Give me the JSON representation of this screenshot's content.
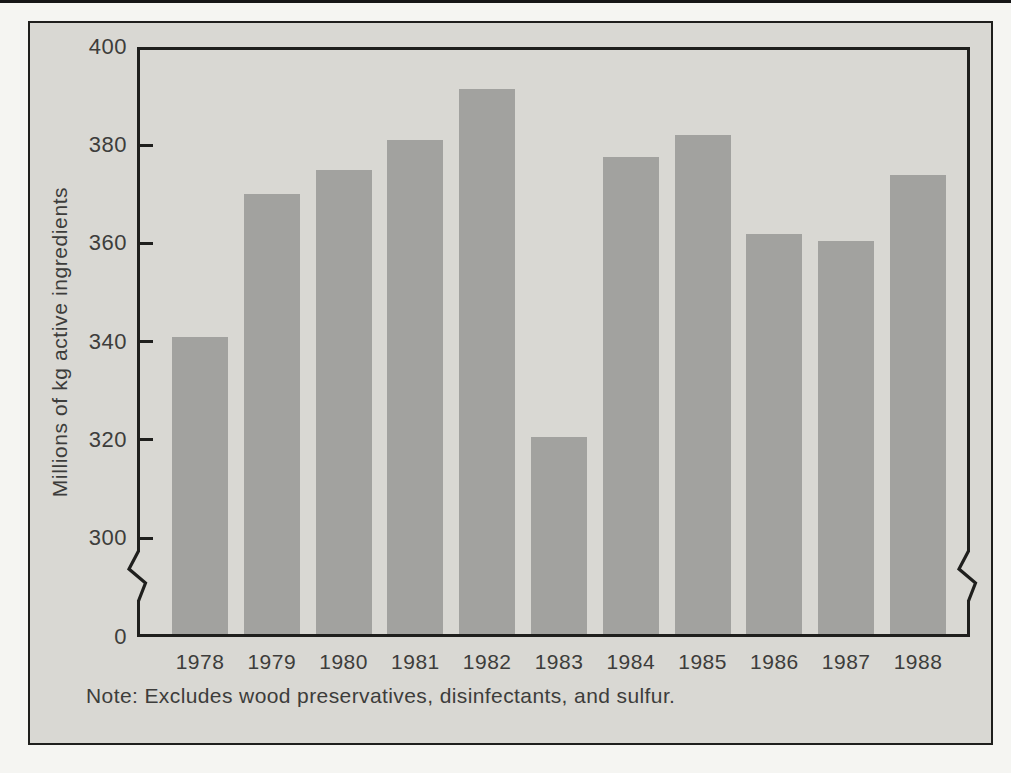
{
  "page": {
    "background": "#f5f5f2"
  },
  "figure": {
    "background": "#d9d8d3",
    "border_color": "#2a2a27"
  },
  "chart_data": {
    "type": "bar",
    "title": "",
    "categories": [
      "1978",
      "1979",
      "1980",
      "1981",
      "1982",
      "1983",
      "1984",
      "1985",
      "1986",
      "1987",
      "1988"
    ],
    "values": [
      341,
      370,
      375,
      381,
      391.5,
      320.5,
      377.5,
      382,
      362,
      360.5,
      374
    ],
    "xlabel": "",
    "ylabel": "Millions of kg active ingredients",
    "y_ticks": [
      0,
      300,
      320,
      340,
      360,
      380,
      400
    ],
    "ylim": [
      0,
      400
    ],
    "axis_break": {
      "axis": "y",
      "between": [
        0,
        300
      ]
    },
    "grid": false,
    "legend": null,
    "note": "Note: Excludes wood preservatives, disinfectants, and sulfur.",
    "bar_color": "#a2a29f",
    "axis_color": "#1f1f1d",
    "text_color": "#3d3d3b"
  }
}
